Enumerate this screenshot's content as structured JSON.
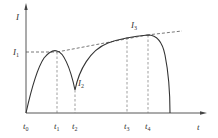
{
  "diagram": {
    "type": "current-time curve with envelope",
    "axes": {
      "y_label": "I",
      "x_label": "t"
    },
    "labels": {
      "I1": {
        "main": "I",
        "sub": "1"
      },
      "I2": {
        "main": "I",
        "sub": "2"
      },
      "I3": {
        "main": "I",
        "sub": "3"
      },
      "t0": {
        "main": "t",
        "sub": "0"
      },
      "t1": {
        "main": "t",
        "sub": "1"
      },
      "t2": {
        "main": "t",
        "sub": "2"
      },
      "t3": {
        "main": "t",
        "sub": "3"
      },
      "t4": {
        "main": "t",
        "sub": "4"
      }
    },
    "colors": {
      "curve": "#333333",
      "axis": "#444444",
      "dashed": "#555555",
      "background": "#ffffff"
    }
  }
}
